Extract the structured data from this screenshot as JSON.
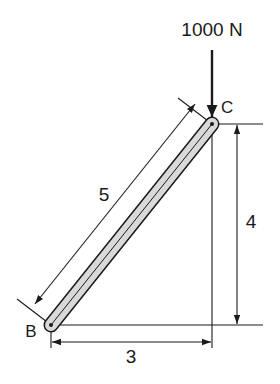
{
  "figure": {
    "load": {
      "label": "1000 N",
      "direction": "down",
      "applied_at": "C"
    },
    "points": [
      {
        "name": "C",
        "label": "C"
      },
      {
        "name": "B",
        "label": "B"
      }
    ],
    "member": {
      "from": "B",
      "to": "C",
      "fill": "#d9d9d9",
      "stroke": "#1a1a1a"
    },
    "dimensions": {
      "length": {
        "label": "5"
      },
      "height": {
        "label": "4"
      },
      "width": {
        "label": "3"
      }
    }
  }
}
